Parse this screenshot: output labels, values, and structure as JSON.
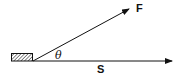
{
  "diagram": {
    "type": "force-displacement",
    "labels": {
      "force": "F",
      "displacement": "S",
      "angle": "θ"
    },
    "colors": {
      "line": "#111111",
      "background": "#ffffff",
      "hatch": "#111111"
    },
    "elements": [
      {
        "name": "block",
        "description": "hatched rectangular block"
      },
      {
        "name": "force-vector",
        "label": "F",
        "direction": "angled up-right"
      },
      {
        "name": "displacement-vector",
        "label": "S",
        "direction": "horizontal right"
      },
      {
        "name": "angle",
        "label": "θ",
        "between": [
          "force-vector",
          "displacement-vector"
        ]
      }
    ]
  }
}
